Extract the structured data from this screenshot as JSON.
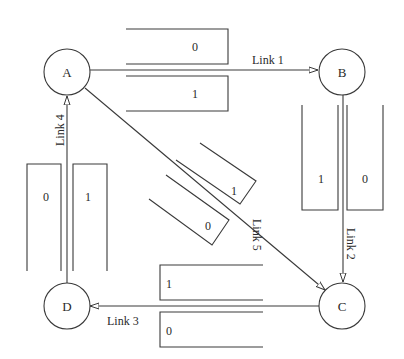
{
  "diagram": {
    "title": "",
    "nodes": [
      {
        "id": "A",
        "label": "A"
      },
      {
        "id": "B",
        "label": "B"
      },
      {
        "id": "C",
        "label": "C"
      },
      {
        "id": "D",
        "label": "D"
      }
    ],
    "links": [
      {
        "id": "link1",
        "label": "Link 1",
        "from": "A",
        "to": "B",
        "buffers": [
          "0",
          "1"
        ]
      },
      {
        "id": "link2",
        "label": "Link 2",
        "from": "B",
        "to": "C",
        "buffers": [
          "1",
          "0"
        ]
      },
      {
        "id": "link3",
        "label": "Link 3",
        "from": "C",
        "to": "D",
        "buffers": [
          "1",
          "0"
        ]
      },
      {
        "id": "link4",
        "label": "Link 4",
        "from": "D",
        "to": "A",
        "buffers": [
          "0",
          "1"
        ]
      },
      {
        "id": "link5",
        "label": "Link 5",
        "from": "A",
        "to": "C",
        "buffers": [
          "1",
          "0"
        ]
      }
    ],
    "colors": {
      "stroke": "#3a3a3a",
      "text": "#2a2a2a",
      "background": "#ffffff"
    }
  }
}
